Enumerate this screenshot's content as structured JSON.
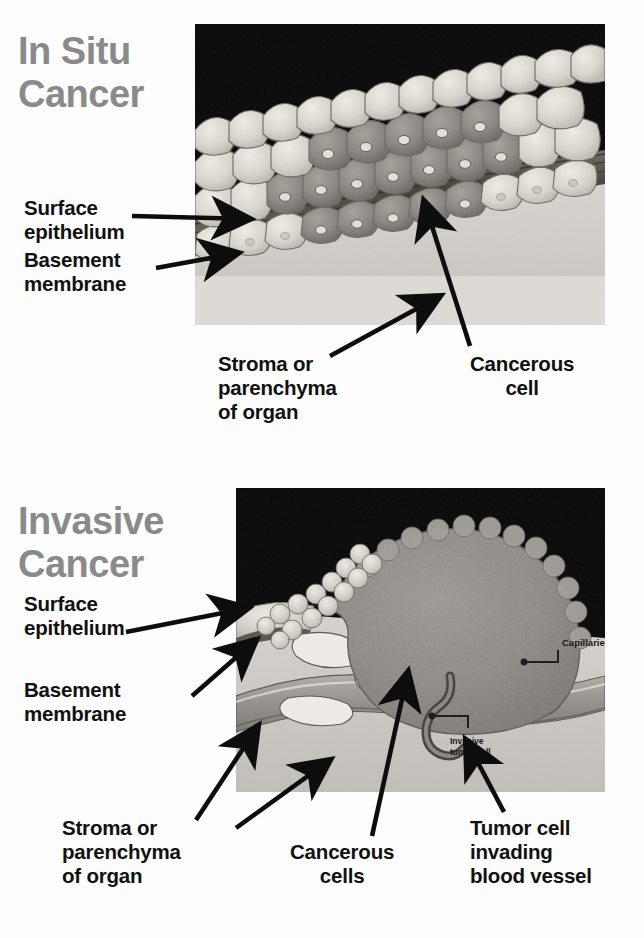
{
  "document": {
    "kind": "medical-illustration-diagram",
    "subject": "Comparison of in situ versus invasive cancer histology"
  },
  "colors": {
    "page_background": "#fdfdfd",
    "heading_gray": "#8a8a8a",
    "label_black": "#111111",
    "panel_dark_background": "#0a0a0a",
    "epithelium_light": "#d8d5cf",
    "cancer_cell_dark": "#8e8b86",
    "basement_membrane": "#55514c",
    "stroma_light": "#cfccc7",
    "tumor_mass": "#8b8883",
    "blood_vessel": "#a5a29c"
  },
  "panels": [
    {
      "id": "in-situ",
      "heading": "In Situ\nCancer",
      "labels": [
        {
          "id": "surface-epithelium",
          "text": "Surface\nepithelium"
        },
        {
          "id": "basement-membrane",
          "text": "Basement\nmembrane"
        },
        {
          "id": "stroma-parenchyma",
          "text": "Stroma or\nparenchyma\nof organ"
        },
        {
          "id": "cancerous-cell",
          "text": "Cancerous\ncell"
        }
      ]
    },
    {
      "id": "invasive",
      "heading": "Invasive\nCancer",
      "labels": [
        {
          "id": "surface-epithelium",
          "text": "Surface\nepithelium"
        },
        {
          "id": "basement-membrane",
          "text": "Basement\nmembrane"
        },
        {
          "id": "stroma-parenchyma",
          "text": "Stroma or\nparenchyma\nof organ"
        },
        {
          "id": "cancerous-cells",
          "text": "Cancerous\ncells"
        },
        {
          "id": "tumor-cell-invading",
          "text": "Tumor cell\ninvading\nblood vessel"
        }
      ],
      "inset_labels": [
        {
          "id": "capillaries",
          "text": "Capillaries"
        },
        {
          "id": "invasive-tumor-cell",
          "text": "Invasive\ntumor cell"
        }
      ]
    }
  ]
}
